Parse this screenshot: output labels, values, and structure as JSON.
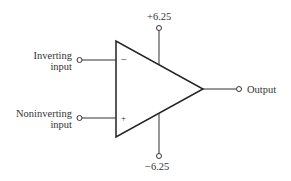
{
  "diagram": {
    "type": "op-amp schematic",
    "inputs": {
      "inverting": {
        "label_line1": "Inverting",
        "label_line2": "input",
        "sign": "−"
      },
      "noninverting": {
        "label_line1": "Noninverting",
        "label_line2": "input",
        "sign": "+"
      }
    },
    "supply": {
      "positive": "+6.25",
      "negative": "−6.25"
    },
    "output": {
      "label": "Output"
    }
  }
}
